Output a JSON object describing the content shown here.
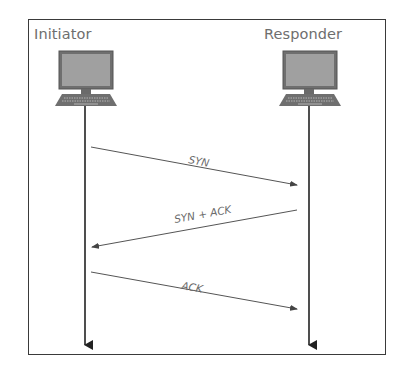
{
  "diagram": {
    "type": "sequence",
    "participants": [
      {
        "name": "Initiator",
        "icon": "desktop-computer-icon"
      },
      {
        "name": "Responder",
        "icon": "desktop-computer-icon"
      }
    ],
    "messages": [
      {
        "label": "SYN",
        "from": "Initiator",
        "to": "Responder"
      },
      {
        "label": "SYN + ACK",
        "from": "Responder",
        "to": "Initiator"
      },
      {
        "label": "ACK",
        "from": "Initiator",
        "to": "Responder"
      }
    ],
    "colors": {
      "frame": "#3a3a3a",
      "label": "#6e6e6e",
      "monitor": "#7a7a7a",
      "screen": "#9a9a9a",
      "lifeline": "#222222",
      "message": "#555555"
    }
  }
}
